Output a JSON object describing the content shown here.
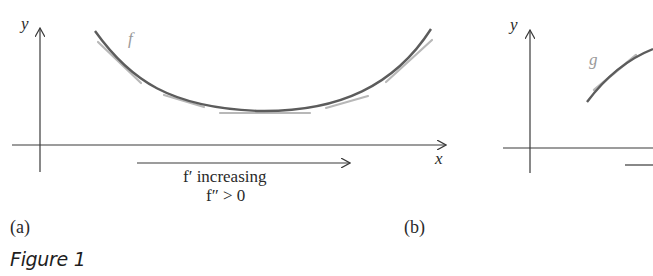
{
  "figure": {
    "caption": "Figure 1",
    "panels": [
      {
        "id": "a",
        "label": "(a)",
        "y_axis_label": "y",
        "x_axis_label": "x",
        "curve_label": "f",
        "curve_shape": "concave up (convex), minimum near center",
        "annotation_line1": "f′ increasing",
        "annotation_line2": "f″ > 0",
        "tangent_lines": "light gray tangent segments along curve"
      },
      {
        "id": "b",
        "label": "(b)",
        "y_axis_label": "y",
        "curve_label": "g",
        "curve_shape": "concave down, increasing (partially cropped)"
      }
    ]
  },
  "colors": {
    "axis": "#3a3a3a",
    "curve": "#5a5a5a",
    "tangent": "#b4b4b4",
    "curve_label": "#9a9a9a",
    "text": "#2a2a2a"
  }
}
